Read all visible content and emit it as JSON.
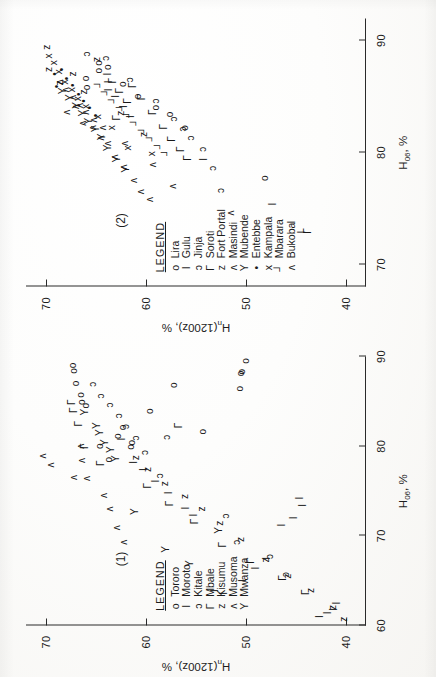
{
  "figure": {
    "orientation": "rotated-90-ccw",
    "background_hex": "#fbfbfa",
    "ink_hex": "#1a1a1a"
  },
  "axes": {
    "xlabel_main": "H",
    "xlabel_sub": "06",
    "xlabel_unit": ", %",
    "ylabel_main": "H",
    "ylabel_sub": "n",
    "ylabel_rest": "(1200z), %",
    "panel1": {
      "xticks": [
        60,
        70,
        80,
        90
      ],
      "xlim": [
        60,
        90
      ],
      "yticks": [
        40,
        50,
        60,
        70
      ],
      "ylim": [
        38,
        72
      ]
    },
    "panel2": {
      "xticks": [
        70,
        80,
        90
      ],
      "xlim": [
        68,
        92
      ],
      "yticks": [
        40,
        50,
        60,
        70
      ],
      "ylim": [
        38,
        72
      ]
    }
  },
  "panels": [
    {
      "tag": "(1)",
      "legend": {
        "title": "LEGEND",
        "entries": [
          {
            "symbol": "o",
            "name": "Tororo"
          },
          {
            "symbol": "I",
            "name": "Moroto"
          },
          {
            "symbol": "ɔ",
            "name": "Kitale"
          },
          {
            "symbol": "Γ",
            "name": "Mbale"
          },
          {
            "symbol": "z",
            "name": "Kisumu"
          },
          {
            "symbol": "ʌ",
            "name": "Musoma"
          },
          {
            "symbol": "Y",
            "name": "Mwanza"
          }
        ]
      }
    },
    {
      "tag": "(2)",
      "legend": {
        "title": "LEGEND",
        "entries": [
          {
            "symbol": "o",
            "name": "Lira"
          },
          {
            "symbol": "I",
            "name": "Gulu"
          },
          {
            "symbol": "ɔ",
            "name": "Jinja"
          },
          {
            "symbol": "Γ",
            "name": "Soroti"
          },
          {
            "symbol": "z",
            "name": "Fort Portal"
          },
          {
            "symbol": "ʌ",
            "name": "Masindi"
          },
          {
            "symbol": "Y",
            "name": "Mubende"
          },
          {
            "symbol": "•",
            "name": "Entebbe"
          },
          {
            "symbol": "x",
            "name": "Kampala"
          },
          {
            "symbol": "┘",
            "name": "Mbarara"
          },
          {
            "symbol": "ʌ",
            "name": "Bukoba"
          }
        ]
      }
    }
  ],
  "chart_data": [
    {
      "type": "scatter",
      "title": "(1)",
      "xlabel": "H06, %",
      "ylabel": "Hn(1200z), %",
      "xlim": [
        60,
        90
      ],
      "ylim": [
        38,
        72
      ],
      "xticks": [
        60,
        70,
        80,
        90
      ],
      "yticks": [
        40,
        50,
        60,
        70
      ],
      "grid": false,
      "legend_position": "lower-left",
      "series": [
        {
          "name": "Tororo",
          "symbol": "o",
          "points": [
            [
              86.8,
              57.2
            ],
            [
              83.9,
              59.6
            ],
            [
              80.4,
              61.4
            ],
            [
              79.9,
              61.5
            ],
            [
              82.1,
              62.3
            ],
            [
              81.1,
              62.8
            ],
            [
              78.5,
              63.7
            ],
            [
              80.0,
              64.6
            ],
            [
              84.5,
              66.0
            ],
            [
              84.9,
              66.4
            ],
            [
              85.7,
              66.5
            ],
            [
              87.0,
              67.0
            ],
            [
              89.0,
              67.3
            ],
            [
              88.4,
              67.2
            ],
            [
              81.6,
              54.3
            ],
            [
              86.4,
              50.6
            ],
            [
              88.1,
              50.5
            ],
            [
              88.3,
              50.4
            ],
            [
              89.5,
              50.0
            ]
          ]
        },
        {
          "name": "Moroto",
          "symbol": "I",
          "points": [
            [
              73.4,
              44.3
            ],
            [
              72.0,
              45.2
            ],
            [
              71.2,
              46.4
            ],
            [
              67.5,
              47.9
            ],
            [
              66.4,
              49.0
            ],
            [
              65.0,
              50.3
            ],
            [
              63.6,
              52.2
            ],
            [
              63.9,
              53.1
            ],
            [
              72.3,
              55.2
            ],
            [
              73.1,
              56.0
            ],
            [
              74.8,
              57.7
            ],
            [
              76.1,
              59.0
            ],
            [
              77.4,
              60.2
            ],
            [
              78.2,
              61.2
            ],
            [
              80.8,
              62.4
            ],
            [
              74.2,
              44.6
            ],
            [
              62.5,
              40.9
            ],
            [
              61.8,
              41.2
            ],
            [
              61.4,
              41.8
            ],
            [
              61.0,
              42.6
            ]
          ]
        },
        {
          "name": "Kitale",
          "symbol": "ɔ",
          "points": [
            [
              83.4,
              62.7
            ],
            [
              84.6,
              63.6
            ],
            [
              85.6,
              64.5
            ],
            [
              86.9,
              65.3
            ],
            [
              82.2,
              62.0
            ],
            [
              80.9,
              61.0
            ],
            [
              79.3,
              60.1
            ],
            [
              76.7,
              58.6
            ],
            [
              72.2,
              52.0
            ],
            [
              69.3,
              50.9
            ],
            [
              67.7,
              47.6
            ],
            [
              65.7,
              46.0
            ],
            [
              81.0,
              57.9
            ]
          ]
        },
        {
          "name": "Mbale",
          "symbol": "Γ",
          "points": [
            [
              84.0,
              67.2
            ],
            [
              84.9,
              67.4
            ],
            [
              82.5,
              66.7
            ],
            [
              80.0,
              66.1
            ],
            [
              78.1,
              64.5
            ],
            [
              75.6,
              59.8
            ],
            [
              73.6,
              57.6
            ],
            [
              71.6,
              55.1
            ],
            [
              69.0,
              52.3
            ],
            [
              67.2,
              49.5
            ],
            [
              65.3,
              46.3
            ],
            [
              63.7,
              44.0
            ],
            [
              82.3,
              56.7
            ]
          ]
        },
        {
          "name": "Kisumu",
          "symbol": "z",
          "points": [
            [
              77.4,
              59.8
            ],
            [
              75.8,
              58.1
            ],
            [
              74.4,
              56.1
            ],
            [
              73.0,
              54.4
            ],
            [
              71.4,
              52.6
            ],
            [
              69.6,
              50.5
            ],
            [
              67.3,
              48.0
            ],
            [
              65.5,
              45.8
            ],
            [
              63.9,
              43.5
            ],
            [
              62.0,
              41.3
            ],
            [
              60.7,
              40.2
            ],
            [
              78.7,
              61.0
            ]
          ]
        },
        {
          "name": "Musoma",
          "symbol": "ʌ",
          "points": [
            [
              80.0,
              66.5
            ],
            [
              78.4,
              66.4
            ],
            [
              76.4,
              65.9
            ],
            [
              74.5,
              64.2
            ],
            [
              73.0,
              63.6
            ],
            [
              70.9,
              62.9
            ],
            [
              69.3,
              62.2
            ],
            [
              76.5,
              67.2
            ],
            [
              77.9,
              69.5
            ],
            [
              78.9,
              70.3
            ]
          ]
        },
        {
          "name": "Mwanza",
          "symbol": "Y",
          "points": [
            [
              82.3,
              64.9
            ],
            [
              81.5,
              64.6
            ],
            [
              80.4,
              64.1
            ],
            [
              79.6,
              63.5
            ],
            [
              78.6,
              63.0
            ],
            [
              83.8,
              66.1
            ],
            [
              72.7,
              61.1
            ],
            [
              68.5,
              58.0
            ],
            [
              66.9,
              55.6
            ],
            [
              70.6,
              52.7
            ]
          ]
        }
      ]
    },
    {
      "type": "scatter",
      "title": "(2)",
      "xlabel": "H06, %",
      "ylabel": "Hn(1200z), %",
      "xlim": [
        68,
        92
      ],
      "ylim": [
        38,
        72
      ],
      "xticks": [
        70,
        80,
        90
      ],
      "yticks": [
        40,
        50,
        60,
        70
      ],
      "grid": false,
      "legend_position": "lower-left",
      "series": [
        {
          "name": "Lira",
          "symbol": "o",
          "points": [
            [
              85.8,
              65.9
            ],
            [
              86.6,
              66.0
            ],
            [
              87.3,
              64.7
            ],
            [
              88.0,
              64.7
            ],
            [
              87.6,
              63.8
            ],
            [
              86.1,
              62.3
            ],
            [
              85.0,
              60.8
            ],
            [
              84.0,
              59.0
            ],
            [
              83.4,
              57.6
            ],
            [
              82.2,
              56.1
            ],
            [
              77.7,
              48.1
            ]
          ]
        },
        {
          "name": "Gulu",
          "symbol": "I",
          "points": [
            [
              85.6,
              63.7
            ],
            [
              86.3,
              63.7
            ],
            [
              87.0,
              63.8
            ],
            [
              85.0,
              63.0
            ],
            [
              84.1,
              62.2
            ],
            [
              83.2,
              61.5
            ],
            [
              79.4,
              54.2
            ],
            [
              75.4,
              47.3
            ],
            [
              73.8,
              45.4
            ],
            [
              72.9,
              44.4
            ]
          ]
        },
        {
          "name": "Jinja",
          "symbol": "ɔ",
          "points": [
            [
              88.8,
              65.9
            ],
            [
              88.4,
              64.0
            ],
            [
              86.5,
              61.6
            ],
            [
              84.6,
              59.0
            ],
            [
              83.0,
              57.2
            ],
            [
              82.1,
              56.3
            ],
            [
              81.3,
              55.5
            ],
            [
              80.3,
              54.3
            ],
            [
              78.6,
              53.3
            ],
            [
              76.6,
              52.5
            ]
          ]
        },
        {
          "name": "Soroti",
          "symbol": "Γ",
          "points": [
            [
              86.4,
              63.3
            ],
            [
              85.5,
              62.6
            ],
            [
              84.6,
              61.8
            ],
            [
              86.0,
              61.3
            ],
            [
              84.9,
              60.4
            ],
            [
              83.6,
              59.3
            ],
            [
              82.3,
              58.2
            ],
            [
              81.2,
              57.4
            ],
            [
              80.3,
              56.5
            ],
            [
              79.5,
              55.8
            ],
            [
              83.1,
              62.9
            ],
            [
              73.0,
              43.8
            ]
          ]
        },
        {
          "name": "Fort Portal",
          "symbol": "z",
          "points": [
            [
              89.4,
              69.9
            ],
            [
              87.4,
              69.7
            ],
            [
              86.2,
              68.6
            ],
            [
              87.0,
              67.3
            ],
            [
              85.4,
              66.2
            ],
            [
              88.3,
              64.9
            ],
            [
              83.5,
              62.5
            ],
            [
              81.6,
              60.2
            ]
          ]
        },
        {
          "name": "Masindi",
          "symbol": "ʌ",
          "points": [
            [
              83.6,
              67.9
            ],
            [
              84.1,
              67.0
            ],
            [
              82.6,
              66.3
            ],
            [
              82.2,
              65.3
            ],
            [
              81.3,
              64.5
            ],
            [
              80.8,
              63.8
            ],
            [
              79.6,
              63.1
            ],
            [
              78.7,
              62.2
            ],
            [
              77.5,
              61.2
            ],
            [
              76.5,
              60.5
            ],
            [
              75.8,
              59.6
            ],
            [
              74.6,
              51.5
            ]
          ]
        },
        {
          "name": "Mubende",
          "symbol": "Y",
          "points": [
            [
              85.5,
              68.3
            ],
            [
              84.9,
              67.6
            ],
            [
              84.2,
              66.9
            ],
            [
              83.5,
              66.3
            ],
            [
              82.8,
              65.7
            ],
            [
              82.1,
              65.0
            ],
            [
              81.4,
              64.4
            ],
            [
              80.4,
              63.8
            ],
            [
              79.4,
              62.9
            ],
            [
              78.5,
              62.0
            ]
          ]
        },
        {
          "name": "Entebbe",
          "symbol": "•",
          "points": [
            [
              87.4,
              68.4
            ],
            [
              86.6,
              67.9
            ],
            [
              86.0,
              67.3
            ],
            [
              85.2,
              66.7
            ],
            [
              84.6,
              66.2
            ],
            [
              84.0,
              65.6
            ],
            [
              83.3,
              65.0
            ],
            [
              85.9,
              68.9
            ],
            [
              87.0,
              69.1
            ]
          ]
        },
        {
          "name": "Kampala",
          "symbol": "x",
          "points": [
            [
              88.6,
              69.7
            ],
            [
              88.0,
              69.2
            ],
            [
              87.2,
              68.7
            ],
            [
              86.3,
              68.1
            ],
            [
              85.6,
              67.4
            ],
            [
              84.8,
              66.8
            ],
            [
              84.1,
              66.0
            ],
            [
              83.2,
              64.8
            ],
            [
              82.2,
              63.4
            ],
            [
              80.4,
              61.8
            ],
            [
              79.9,
              59.4
            ]
          ]
        },
        {
          "name": "Mbarara",
          "symbol": "┘",
          "points": [
            [
              86.1,
              64.6
            ],
            [
              85.4,
              63.9
            ],
            [
              84.7,
              63.2
            ],
            [
              84.0,
              62.4
            ],
            [
              83.4,
              61.7
            ],
            [
              82.7,
              61.0
            ],
            [
              82.0,
              60.2
            ],
            [
              81.3,
              59.4
            ],
            [
              80.6,
              58.6
            ],
            [
              80.0,
              57.9
            ]
          ]
        },
        {
          "name": "Bukoba",
          "symbol": "ʌ",
          "points": [
            [
              86.3,
              68.6
            ],
            [
              85.6,
              68.0
            ],
            [
              84.9,
              67.3
            ],
            [
              84.2,
              66.6
            ],
            [
              83.6,
              66.0
            ],
            [
              82.9,
              65.2
            ],
            [
              82.2,
              64.3
            ],
            [
              80.8,
              62.1
            ],
            [
              78.9,
              59.3
            ],
            [
              77.0,
              57.3
            ]
          ]
        }
      ]
    }
  ]
}
